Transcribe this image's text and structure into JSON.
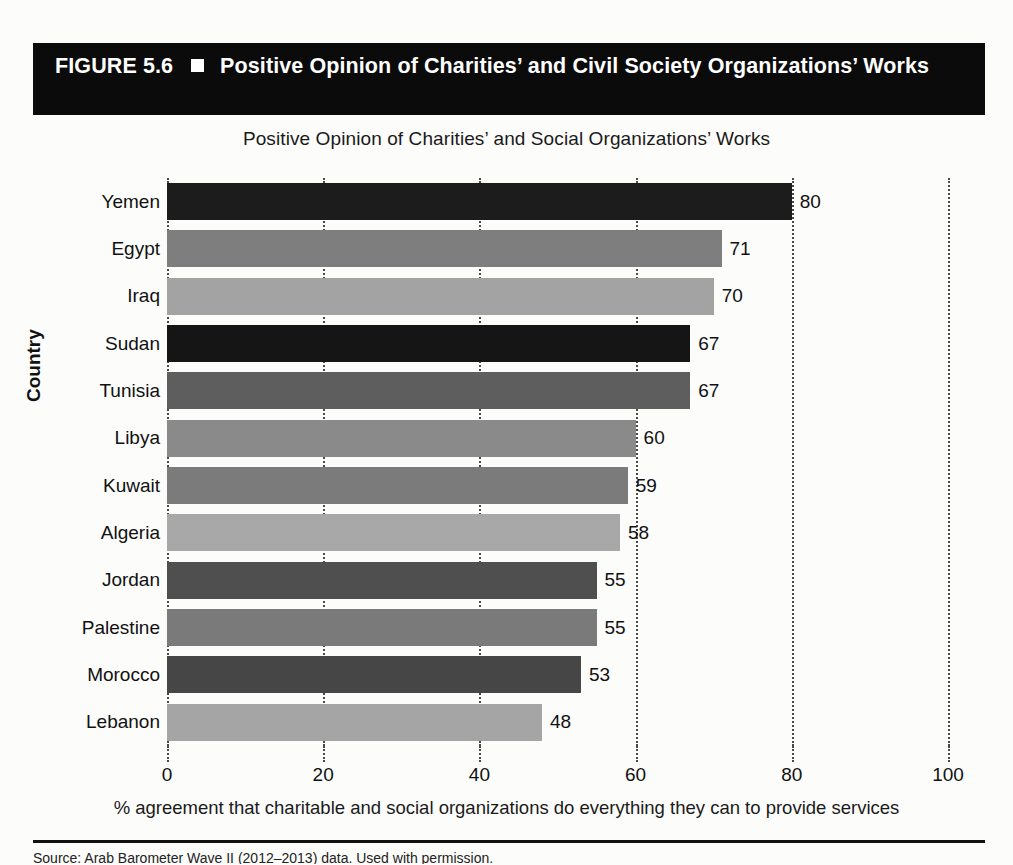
{
  "banner": {
    "figure_label": "FIGURE 5.6",
    "bullet_icon": "filled-square-icon",
    "title": "Positive Opinion of Charities’ and Civil Society Organizations’ Works"
  },
  "footer": {
    "source_note": "Source: Arab Barometer Wave II (2012–2013) data. Used with permission."
  },
  "chart_data": {
    "type": "bar",
    "orientation": "horizontal",
    "title": "Positive Opinion of Charities’ and Social Organizations’ Works",
    "xlabel": "% agreement that charitable and social organizations do everything they can to provide services",
    "ylabel": "Country",
    "xlim": [
      0,
      100
    ],
    "xticks": [
      0,
      20,
      40,
      60,
      80,
      100
    ],
    "grid": "vertical-dotted",
    "legend": "none",
    "categories": [
      "Yemen",
      "Egypt",
      "Iraq",
      "Sudan",
      "Tunisia",
      "Libya",
      "Kuwait",
      "Algeria",
      "Jordan",
      "Palestine",
      "Morocco",
      "Lebanon"
    ],
    "values": [
      80,
      71,
      70,
      67,
      67,
      60,
      59,
      58,
      55,
      55,
      53,
      48
    ],
    "bar_colors": [
      "#1c1c1c",
      "#7e7e7e",
      "#a3a3a3",
      "#151515",
      "#5e5e5e",
      "#8a8a8a",
      "#7b7b7b",
      "#a8a8a8",
      "#4f4f4f",
      "#7a7a7a",
      "#464646",
      "#a5a5a5"
    ]
  }
}
